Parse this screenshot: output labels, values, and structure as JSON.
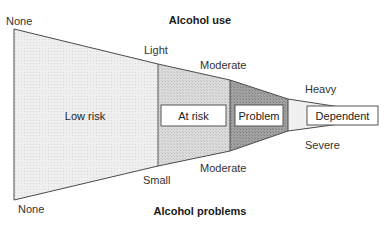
{
  "diagram": {
    "top_title": "Alcohol use",
    "bottom_title": "Alcohol problems",
    "use_levels": [
      "None",
      "Light",
      "Moderate",
      "Heavy"
    ],
    "problem_levels": [
      "None",
      "Small",
      "Moderate",
      "Severe"
    ],
    "zones": [
      {
        "label": "Low risk",
        "boxed": false,
        "color": "#ececec"
      },
      {
        "label": "At risk",
        "boxed": true,
        "color": "#d6d6d6"
      },
      {
        "label": "Problem",
        "boxed": true,
        "color": "#9c9c9c"
      },
      {
        "label": "Dependent",
        "boxed": true,
        "color": "#f0f0f0"
      }
    ],
    "outline_color": "#555555"
  }
}
